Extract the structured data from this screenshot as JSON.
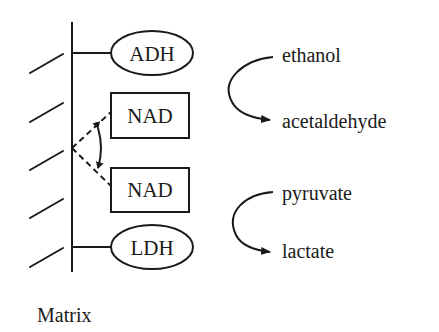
{
  "diagram": {
    "type": "membrane-bound enzyme schematic",
    "membrane_label": "Matrix",
    "enzymes": [
      {
        "id": "adh",
        "label": "ADH",
        "shape": "ellipse"
      },
      {
        "id": "ldh",
        "label": "LDH",
        "shape": "ellipse"
      }
    ],
    "cofactors": [
      {
        "id": "nad_top",
        "label": "NAD",
        "shape": "box"
      },
      {
        "id": "nad_bottom",
        "label": "NAD",
        "shape": "box"
      }
    ],
    "reactions": [
      {
        "substrate": "ethanol",
        "product": "acetaldehyde"
      },
      {
        "substrate": "pyruvate",
        "product": "lactate"
      }
    ],
    "colors": {
      "ink": "#1a1a1a",
      "background": "#ffffff"
    }
  }
}
